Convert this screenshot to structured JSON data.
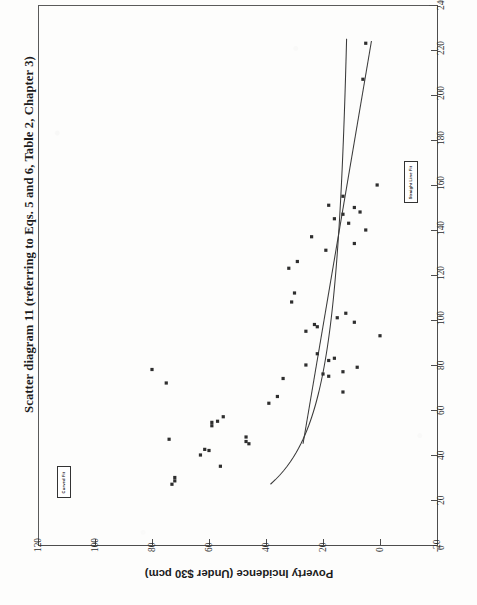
{
  "figure": {
    "title": "Scatter diagram 11 (referring to Eqs. 5 and 6, Table 2, Chapter 3)",
    "orientation": "rotated-90-ccw",
    "ylabel": "Poverty Incidence (Under $30 pcm)"
  },
  "legend": {
    "curved_fit": "Curved Fit",
    "straight_line_fit": "Straight Line Fit"
  },
  "chart_data": {
    "type": "scatter",
    "title": "Scatter diagram 11 (referring to Eqs. 5 and 6, Table 2, Chapter 3)",
    "xlabel": "",
    "ylabel": "Poverty Incidence (Under $30 pcm)",
    "xlim": [
      0,
      240
    ],
    "ylim": [
      -20,
      120
    ],
    "xticks": [
      0,
      20,
      40,
      60,
      80,
      100,
      120,
      140,
      160,
      180,
      200,
      220,
      240
    ],
    "yticks": [
      -20,
      0,
      20,
      40,
      60,
      80,
      100,
      120
    ],
    "grid": false,
    "legend_position": "in-plot-boxed-annotations",
    "legend": [
      "Curved Fit",
      "Straight Line Fit"
    ],
    "points": [
      {
        "x": 27,
        "y": 73
      },
      {
        "x": 28.5,
        "y": 72
      },
      {
        "x": 30,
        "y": 72
      },
      {
        "x": 35,
        "y": 56
      },
      {
        "x": 40,
        "y": 63
      },
      {
        "x": 42,
        "y": 60
      },
      {
        "x": 42.5,
        "y": 61.5
      },
      {
        "x": 45,
        "y": 46
      },
      {
        "x": 46,
        "y": 47
      },
      {
        "x": 47,
        "y": 74
      },
      {
        "x": 48,
        "y": 47
      },
      {
        "x": 53,
        "y": 59
      },
      {
        "x": 54.5,
        "y": 59
      },
      {
        "x": 55,
        "y": 57
      },
      {
        "x": 57,
        "y": 55
      },
      {
        "x": 63,
        "y": 39
      },
      {
        "x": 66,
        "y": 36
      },
      {
        "x": 68,
        "y": 13
      },
      {
        "x": 72,
        "y": 75
      },
      {
        "x": 74,
        "y": 34
      },
      {
        "x": 75,
        "y": 18
      },
      {
        "x": 76,
        "y": 20
      },
      {
        "x": 77,
        "y": 13
      },
      {
        "x": 78,
        "y": 80
      },
      {
        "x": 79,
        "y": 8
      },
      {
        "x": 80,
        "y": 26
      },
      {
        "x": 82,
        "y": 18
      },
      {
        "x": 83,
        "y": 16
      },
      {
        "x": 85,
        "y": 22
      },
      {
        "x": 93,
        "y": 0
      },
      {
        "x": 95,
        "y": 26
      },
      {
        "x": 97,
        "y": 22
      },
      {
        "x": 98,
        "y": 23
      },
      {
        "x": 99,
        "y": 9
      },
      {
        "x": 101,
        "y": 15
      },
      {
        "x": 103,
        "y": 12
      },
      {
        "x": 108,
        "y": 31
      },
      {
        "x": 112,
        "y": 30
      },
      {
        "x": 123,
        "y": 32
      },
      {
        "x": 126,
        "y": 29
      },
      {
        "x": 131,
        "y": 19
      },
      {
        "x": 134,
        "y": 9
      },
      {
        "x": 137,
        "y": 24
      },
      {
        "x": 140,
        "y": 5
      },
      {
        "x": 143,
        "y": 11
      },
      {
        "x": 145,
        "y": 16
      },
      {
        "x": 147,
        "y": 13
      },
      {
        "x": 148,
        "y": 7
      },
      {
        "x": 150,
        "y": 9
      },
      {
        "x": 151,
        "y": 18
      },
      {
        "x": 155,
        "y": 13
      },
      {
        "x": 160,
        "y": 1
      },
      {
        "x": 207,
        "y": 6
      },
      {
        "x": 223,
        "y": 5
      }
    ],
    "fits": [
      {
        "name": "Curved Fit",
        "style": "solid-curve",
        "description": "convex decreasing curve from (27,100) falling toward (225,5)"
      },
      {
        "name": "Straight Line Fit",
        "style": "solid-line",
        "description": "steep line from (45,27) rising to (224,3)"
      }
    ]
  },
  "axes": {
    "x_ticks": [
      "0",
      "20",
      "40",
      "60",
      "80",
      "100",
      "120",
      "140",
      "160",
      "180",
      "200",
      "220",
      "240"
    ],
    "y_ticks": [
      "120",
      "100",
      "80",
      "60",
      "40",
      "20",
      "0",
      "-20"
    ]
  }
}
